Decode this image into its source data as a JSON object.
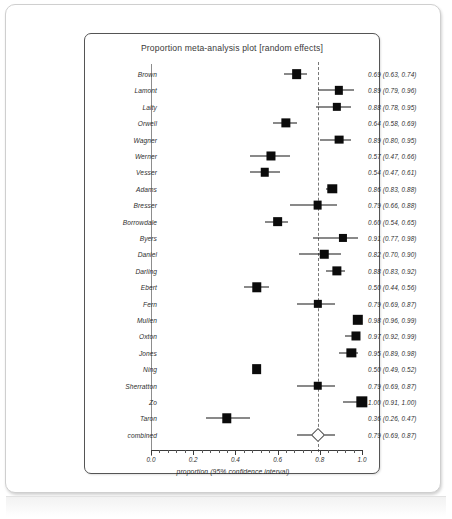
{
  "chart_data": {
    "type": "forest",
    "title": "Proportion meta-analysis plot [random effects]",
    "xlabel": "proportion (95% confidence interval)",
    "ylabel": "",
    "xlim": [
      0.0,
      1.0
    ],
    "xticks": [
      "0.0",
      "0.2",
      "0.4",
      "0.6",
      "0.8",
      "1.0"
    ],
    "xtick_values": [
      0.0,
      0.2,
      0.4,
      0.6,
      0.8,
      1.0
    ],
    "grid": false,
    "legend": "none",
    "reference_line": 0.79,
    "combined_label": "combined",
    "studies": [
      {
        "label": "Brown",
        "estimate": 0.69,
        "lower": 0.63,
        "upper": 0.74,
        "weight": 0.55,
        "text": "0.69 (0.63, 0.74)"
      },
      {
        "label": "Lamont",
        "estimate": 0.89,
        "lower": 0.79,
        "upper": 0.96,
        "weight": 0.4,
        "text": "0.89 (0.79, 0.96)"
      },
      {
        "label": "Laity",
        "estimate": 0.88,
        "lower": 0.78,
        "upper": 0.95,
        "weight": 0.4,
        "text": "0.88 (0.78, 0.95)"
      },
      {
        "label": "Orwell",
        "estimate": 0.64,
        "lower": 0.58,
        "upper": 0.69,
        "weight": 0.5,
        "text": "0.64 (0.58, 0.69)"
      },
      {
        "label": "Wagner",
        "estimate": 0.89,
        "lower": 0.8,
        "upper": 0.95,
        "weight": 0.45,
        "text": "0.89 (0.80, 0.95)"
      },
      {
        "label": "Werner",
        "estimate": 0.57,
        "lower": 0.47,
        "upper": 0.66,
        "weight": 0.48,
        "text": "0.57 (0.47, 0.66)"
      },
      {
        "label": "Vesser",
        "estimate": 0.54,
        "lower": 0.47,
        "upper": 0.61,
        "weight": 0.42,
        "text": "0.54 (0.47, 0.61)"
      },
      {
        "label": "Adams",
        "estimate": 0.86,
        "lower": 0.83,
        "upper": 0.88,
        "weight": 0.52,
        "text": "0.86 (0.83, 0.88)"
      },
      {
        "label": "Bresser",
        "estimate": 0.79,
        "lower": 0.66,
        "upper": 0.88,
        "weight": 0.45,
        "text": "0.79 (0.66, 0.88)"
      },
      {
        "label": "Borrowdale",
        "estimate": 0.6,
        "lower": 0.54,
        "upper": 0.65,
        "weight": 0.55,
        "text": "0.60 (0.54, 0.65)"
      },
      {
        "label": "Byers",
        "estimate": 0.91,
        "lower": 0.77,
        "upper": 0.98,
        "weight": 0.38,
        "text": "0.91 (0.77, 0.98)"
      },
      {
        "label": "Daniel",
        "estimate": 0.82,
        "lower": 0.7,
        "upper": 0.9,
        "weight": 0.42,
        "text": "0.82 (0.70, 0.90)"
      },
      {
        "label": "Darling",
        "estimate": 0.88,
        "lower": 0.83,
        "upper": 0.92,
        "weight": 0.5,
        "text": "0.88 (0.83, 0.92)"
      },
      {
        "label": "Ebert",
        "estimate": 0.5,
        "lower": 0.44,
        "upper": 0.56,
        "weight": 0.52,
        "text": "0.50 (0.44, 0.56)"
      },
      {
        "label": "Fern",
        "estimate": 0.79,
        "lower": 0.69,
        "upper": 0.87,
        "weight": 0.4,
        "text": "0.79 (0.69, 0.87)"
      },
      {
        "label": "Mullen",
        "estimate": 0.98,
        "lower": 0.96,
        "upper": 0.99,
        "weight": 0.62,
        "text": "0.98 (0.96, 0.99)"
      },
      {
        "label": "Oxton",
        "estimate": 0.97,
        "lower": 0.92,
        "upper": 0.99,
        "weight": 0.48,
        "text": "0.97 (0.92, 0.99)"
      },
      {
        "label": "Jones",
        "estimate": 0.95,
        "lower": 0.89,
        "upper": 0.98,
        "weight": 0.5,
        "text": "0.95 (0.89, 0.98)"
      },
      {
        "label": "Ning",
        "estimate": 0.5,
        "lower": 0.49,
        "upper": 0.52,
        "weight": 0.55,
        "text": "0.50 (0.49, 0.52)"
      },
      {
        "label": "Sherratton",
        "estimate": 0.79,
        "lower": 0.69,
        "upper": 0.87,
        "weight": 0.42,
        "text": "0.79 (0.69, 0.87)"
      },
      {
        "label": "Zo",
        "estimate": 1.0,
        "lower": 0.91,
        "upper": 1.0,
        "weight": 0.72,
        "text": "1.00 (0.91, 1.00)"
      },
      {
        "label": "Taron",
        "estimate": 0.36,
        "lower": 0.26,
        "upper": 0.47,
        "weight": 0.52,
        "text": "0.36 (0.26, 0.47)"
      }
    ],
    "combined": {
      "label": "combined",
      "estimate": 0.79,
      "lower": 0.69,
      "upper": 0.87,
      "text": "0.79 (0.69, 0.87)"
    }
  },
  "colors": {
    "marker": "#0b0b0b",
    "line": "#141414",
    "reference": "#777777",
    "panel_border": "#555555",
    "text": "#2e2e2e"
  }
}
